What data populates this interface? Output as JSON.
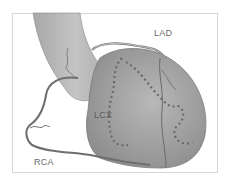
{
  "diagram": {
    "labels": {
      "lad": "LAD",
      "lcx": "LCX",
      "rca": "RCA"
    },
    "colors": {
      "heart_fill": "#9a9a9a",
      "heart_light": "#c8c8c8",
      "artery": "#6e6e6e",
      "dotted_territory": "#6a6a6a",
      "frame_border": "#d6d6d6",
      "label_text": "#6a6a6a"
    }
  }
}
